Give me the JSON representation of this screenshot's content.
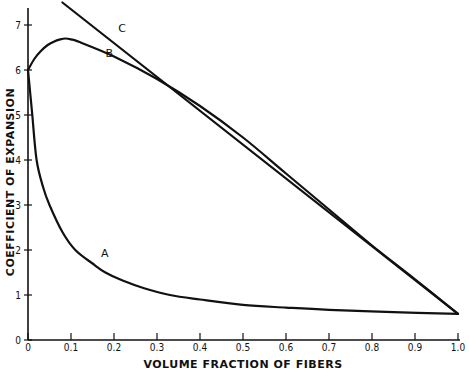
{
  "chart_data": {
    "type": "line",
    "title": "",
    "xlabel": "VOLUME FRACTION OF FIBERS",
    "ylabel": "COEFFICIENT OF EXPANSION",
    "xlim": [
      0,
      1.0
    ],
    "ylim": [
      0,
      7.5
    ],
    "grid": false,
    "legend": "curve labels placed inline (A, B, C)",
    "x_ticks": [
      0,
      0.1,
      0.2,
      0.3,
      0.4,
      0.5,
      0.6,
      0.7,
      0.8,
      0.9,
      1.0
    ],
    "x_tick_labels": [
      "0",
      "0.1",
      "0.2",
      "0.3",
      "0.4",
      "0.5",
      "0.6",
      "0.7",
      "0.8",
      "0.9",
      "1.0"
    ],
    "y_ticks": [
      0,
      1,
      2,
      3,
      4,
      5,
      6,
      7
    ],
    "y_tick_labels": [
      "0",
      "1",
      "2",
      "3",
      "4",
      "5",
      "6",
      "7"
    ],
    "series": [
      {
        "name": "A",
        "label_pos": [
          0.17,
          1.85
        ],
        "x": [
          0,
          0.005,
          0.01,
          0.02,
          0.035,
          0.05,
          0.08,
          0.11,
          0.15,
          0.18,
          0.22,
          0.27,
          0.33,
          0.4,
          0.5,
          0.6,
          0.7,
          0.85,
          1.0
        ],
        "y": [
          6.0,
          5.5,
          5.0,
          4.0,
          3.4,
          3.0,
          2.4,
          2.0,
          1.7,
          1.5,
          1.32,
          1.15,
          1.0,
          0.9,
          0.78,
          0.72,
          0.67,
          0.62,
          0.58
        ]
      },
      {
        "name": "B",
        "label_pos": [
          0.18,
          6.3
        ],
        "x": [
          0,
          0.015,
          0.03,
          0.045,
          0.06,
          0.075,
          0.087,
          0.1,
          0.12,
          0.2,
          0.3,
          0.4,
          0.5,
          0.6,
          0.7,
          0.8,
          0.9,
          1.0
        ],
        "y": [
          6.0,
          6.25,
          6.42,
          6.55,
          6.63,
          6.68,
          6.7,
          6.68,
          6.62,
          6.3,
          5.8,
          5.2,
          4.5,
          3.7,
          2.9,
          2.1,
          1.35,
          0.58
        ]
      },
      {
        "name": "C",
        "label_pos": [
          0.21,
          6.85
        ],
        "x": [
          0.08,
          1.0
        ],
        "y": [
          7.5,
          0.58
        ]
      }
    ]
  }
}
